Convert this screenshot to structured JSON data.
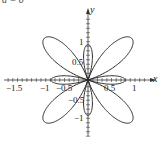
{
  "caption": "a = 0",
  "chart_data": {
    "type": "line",
    "title": "",
    "subtitle": "Polar curve with four outer lobes and four inner loops",
    "xlabel": "x",
    "ylabel": "y",
    "xlim": [
      -1.75,
      1.3
    ],
    "ylim": [
      -1.45,
      1.45
    ],
    "grid": false,
    "legend": null,
    "x_ticks": [
      "-1.5",
      "-1",
      "-0.5",
      "0.5",
      "1"
    ],
    "y_ticks": [
      "1",
      "0.5",
      "-0.5",
      "-1"
    ],
    "series": [
      {
        "name": "curve",
        "formula": "r = 0.25 - cos(4*theta)",
        "color": "#333333",
        "key_points": [
          {
            "x": 1.0,
            "y": 0.0,
            "note": "outer lobes cross x-axis"
          },
          {
            "x": -1.0,
            "y": 0.0
          },
          {
            "x": 0.0,
            "y": 1.2,
            "note": "outer lobes meet above y-axis"
          },
          {
            "x": 0.0,
            "y": -1.2
          },
          {
            "x": 0.5,
            "y": 0.0,
            "note": "inner loop right, spans 0.5 to 1"
          },
          {
            "x": -0.5,
            "y": 0.0,
            "note": "inner loop left, spans -1 to -0.5"
          },
          {
            "x": 0.0,
            "y": 0.65,
            "note": "inner loop top, spans ~0.65 to 1.2"
          },
          {
            "x": 0.0,
            "y": -0.65,
            "note": "inner loop bottom"
          }
        ]
      }
    ]
  },
  "colors": {
    "axis": "#333333",
    "curve": "#2b2b2b",
    "text": "#222222"
  },
  "ticks": {
    "x": [
      {
        "label": "-1.5",
        "left": 6,
        "top": 84
      },
      {
        "label": "-1",
        "left": 40,
        "top": 84
      },
      {
        "label": "-0.5",
        "left": 56,
        "top": 84
      },
      {
        "label": "0.5",
        "left": 104,
        "top": 84
      },
      {
        "label": "1",
        "left": 132,
        "top": 84
      }
    ],
    "y": [
      {
        "label": "1",
        "left": 79,
        "top": 38
      },
      {
        "label": "0.5",
        "left": 72,
        "top": 58
      },
      {
        "label": "-0.5",
        "left": 68,
        "top": 96
      },
      {
        "label": "-1",
        "left": 74,
        "top": 114
      }
    ]
  },
  "axis_labels": {
    "x": "x",
    "y": "y"
  }
}
